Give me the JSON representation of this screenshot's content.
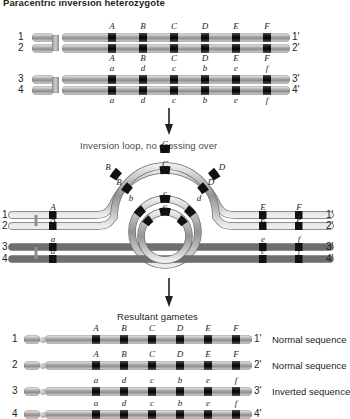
{
  "figure": {
    "title": "Paracentric inversion heterozygote",
    "step_captions": {
      "loop": "Inversion loop, no crossing over",
      "gametes": "Resultant gametes"
    },
    "arrow_icon": "down-arrow-icon"
  },
  "top_pair": {
    "label": "normal homolog pair",
    "rows": [
      {
        "left_number": "1",
        "right_number": "1'",
        "loci": [
          "A",
          "B",
          "C",
          "D",
          "E",
          "F"
        ],
        "label_side": "above"
      },
      {
        "left_number": "2",
        "right_number": "2'",
        "loci": [
          "A",
          "B",
          "C",
          "D",
          "E",
          "F"
        ],
        "label_side": "below"
      }
    ]
  },
  "bottom_pair": {
    "label": "inverted homolog pair",
    "rows": [
      {
        "left_number": "3",
        "right_number": "3'",
        "loci": [
          "a",
          "d",
          "c",
          "b",
          "e",
          "f"
        ],
        "label_side": "above"
      },
      {
        "left_number": "4",
        "right_number": "4'",
        "loci": [
          "a",
          "d",
          "c",
          "b",
          "e",
          "f"
        ],
        "label_side": "below"
      }
    ]
  },
  "loop_stage": {
    "left_loci": [
      {
        "text": "A",
        "chromatid": "1"
      },
      {
        "text": "A",
        "chromatid": "2"
      },
      {
        "text": "a",
        "chromatid": "3"
      },
      {
        "text": "a",
        "chromatid": "4"
      }
    ],
    "right_loci": [
      {
        "text": "E",
        "chromatid": "1"
      },
      {
        "text": "F",
        "chromatid": "1"
      },
      {
        "text": "E",
        "chromatid": "2"
      },
      {
        "text": "F",
        "chromatid": "2"
      },
      {
        "text": "e",
        "chromatid": "3"
      },
      {
        "text": "f",
        "chromatid": "3"
      },
      {
        "text": "e",
        "chromatid": "4"
      },
      {
        "text": "f",
        "chromatid": "4"
      }
    ],
    "loop_loci": [
      {
        "text": "B",
        "chromatid": "1"
      },
      {
        "text": "C",
        "chromatid": "1"
      },
      {
        "text": "D",
        "chromatid": "1"
      },
      {
        "text": "B",
        "chromatid": "2"
      },
      {
        "text": "C",
        "chromatid": "2"
      },
      {
        "text": "D",
        "chromatid": "2"
      },
      {
        "text": "b",
        "chromatid": "3"
      },
      {
        "text": "c",
        "chromatid": "3"
      },
      {
        "text": "d",
        "chromatid": "3"
      },
      {
        "text": "b",
        "chromatid": "4"
      },
      {
        "text": "c",
        "chromatid": "4"
      },
      {
        "text": "d",
        "chromatid": "4"
      }
    ],
    "end_numbers_left": [
      "1",
      "2",
      "3",
      "4"
    ],
    "end_numbers_right": [
      "1'",
      "2'",
      "3'",
      "4'"
    ]
  },
  "gametes": {
    "rows": [
      {
        "left_number": "1",
        "right_number": "1'",
        "loci": [
          "A",
          "B",
          "C",
          "D",
          "E",
          "F"
        ],
        "annotation": "Normal sequence"
      },
      {
        "left_number": "2",
        "right_number": "2'",
        "loci": [
          "A",
          "B",
          "C",
          "D",
          "E",
          "F"
        ],
        "annotation": "Normal sequence"
      },
      {
        "left_number": "3",
        "right_number": "3'",
        "loci": [
          "a",
          "d",
          "c",
          "b",
          "e",
          "f"
        ],
        "annotation": "Inverted sequence"
      },
      {
        "left_number": "4",
        "right_number": "4'",
        "loci": [
          "a",
          "d",
          "c",
          "b",
          "e",
          "f"
        ],
        "annotation": ""
      }
    ]
  },
  "colors": {
    "chromosome_body": "#a8a8a8",
    "band": "#000000",
    "text": "#231f20",
    "caption": "#4d4d4f"
  }
}
